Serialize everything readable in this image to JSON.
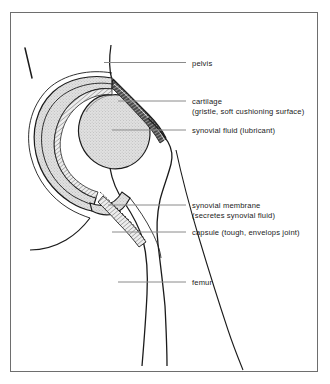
{
  "figure": {
    "frame_color": "#6e6e6e",
    "ink_color": "#1b1b1b",
    "leader_color": "#8a8a8a",
    "bone_fill": "#ffffff",
    "cartilage_fill": "#3c3c3c",
    "synovial_fill": "#d9d9d9",
    "capsule_fill": "#e2e2e2"
  },
  "labels": [
    {
      "id": "pelvis",
      "icon": "leader-line",
      "line1": "pelvis",
      "line2": ""
    },
    {
      "id": "cartilage",
      "icon": "leader-line",
      "line1": "cartilage",
      "line2": "(gristle, soft cushioning surface)"
    },
    {
      "id": "synovial-fluid",
      "icon": "leader-line",
      "line1": "synovial fluid (lubricant)",
      "line2": ""
    },
    {
      "id": "synovial-membrane",
      "icon": "leader-line",
      "line1": "synovial membrane",
      "line2": "(secretes synovial fluid)"
    },
    {
      "id": "capsule",
      "icon": "leader-line",
      "line1": "capsule (tough, envelops joint)",
      "line2": ""
    },
    {
      "id": "femur",
      "icon": "leader-line",
      "line1": "femur",
      "line2": ""
    }
  ]
}
